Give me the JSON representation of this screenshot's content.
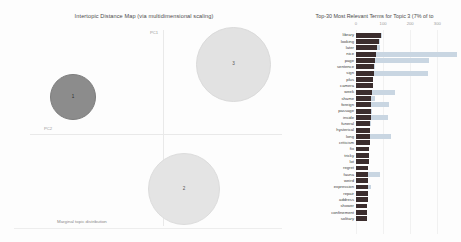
{
  "left_panel": {
    "title": "Intertopic Distance Map (via multidimensional scaling)",
    "pc1_label": "PC1",
    "pc2_label": "PC2",
    "legend_caption": "Marginal topic distribution",
    "bubbles": [
      {
        "id": "1",
        "label": "1",
        "selected": true
      },
      {
        "id": "3",
        "label": "3",
        "selected": false
      },
      {
        "id": "2",
        "label": "2",
        "selected": false
      }
    ]
  },
  "right_panel": {
    "title": "Top-30 Most Relevant Terms for Topic 3 (7% of to",
    "colors": {
      "topic_term_frequency": "#3b2d2d",
      "overall_term_frequency": "#c9d6e2"
    }
  },
  "chart_data": {
    "type": "bar",
    "title": "Top-30 Most Relevant Terms for Topic 3 (7% of to",
    "xlabel": "",
    "ylabel": "",
    "xlim": [
      0,
      380
    ],
    "ticks": [
      0,
      100,
      200,
      300
    ],
    "grid": true,
    "legend": [
      "Overall term frequency",
      "Estimated term frequency within the selected topic"
    ],
    "categories": [
      "library",
      "looking",
      "later",
      "nice",
      "page",
      "sentence",
      "sign",
      "plus",
      "camera",
      "week",
      "shame",
      "foreign",
      "passage",
      "inside",
      "funeral",
      "hysterical",
      "long",
      "criticism",
      "fix",
      "tricky",
      "lot",
      "regret",
      "fauna",
      "weird",
      "expression",
      "repair",
      "address",
      "shower",
      "confinement",
      "solitary"
    ],
    "series": [
      {
        "name": "Estimated term frequency within the selected topic",
        "values": [
          92,
          86,
          78,
          72,
          70,
          68,
          66,
          64,
          62,
          58,
          57,
          56,
          55,
          54,
          53,
          52,
          51,
          50,
          49,
          48,
          47,
          46,
          45,
          45,
          44,
          43,
          43,
          42,
          42,
          41
        ]
      },
      {
        "name": "Overall term frequency",
        "values": [
          96,
          88,
          88,
          372,
          268,
          70,
          266,
          64,
          62,
          145,
          70,
          120,
          60,
          118,
          54,
          52,
          128,
          50,
          49,
          48,
          47,
          46,
          90,
          45,
          55,
          43,
          43,
          42,
          42,
          41
        ]
      }
    ]
  }
}
